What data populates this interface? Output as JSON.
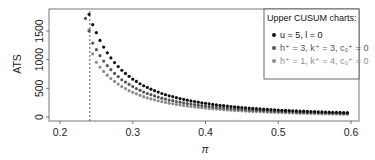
{
  "chart_data": {
    "type": "scatter",
    "title": "",
    "xlabel": "π",
    "ylabel": "ATS",
    "xlim": [
      0.185,
      0.61
    ],
    "ylim": [
      -60,
      1880
    ],
    "x_ticks": [
      0.2,
      0.3,
      0.4,
      0.5,
      0.6
    ],
    "x_tick_labels": [
      "0.2",
      "0.3",
      "0.4",
      "0.5",
      "0.6"
    ],
    "y_ticks": [
      0,
      500,
      1000,
      1500
    ],
    "y_tick_labels": [
      "0",
      "500",
      "1000",
      "1500"
    ],
    "grid": false,
    "reference_line": {
      "orientation": "vertical",
      "x": 0.241,
      "style": "dashed",
      "color": "#333333"
    },
    "legend": {
      "title": "Upper CUSUM charts:",
      "position": "top-right",
      "entries": [
        {
          "label": "u = 5, l = 0",
          "color": "#111111"
        },
        {
          "label": "h⁺ = 3, k⁺ = 3, c₀⁺ = 0",
          "color": "#555555"
        },
        {
          "label": "h⁺ = 1, k⁺ = 4, c₀⁺ = 0",
          "color": "#8c8c8c"
        }
      ]
    },
    "x": [
      0.24,
      0.245,
      0.25,
      0.255,
      0.26,
      0.265,
      0.27,
      0.275,
      0.28,
      0.285,
      0.29,
      0.295,
      0.3,
      0.305,
      0.31,
      0.315,
      0.32,
      0.325,
      0.33,
      0.335,
      0.34,
      0.345,
      0.35,
      0.355,
      0.36,
      0.365,
      0.37,
      0.375,
      0.38,
      0.385,
      0.39,
      0.395,
      0.4,
      0.405,
      0.41,
      0.415,
      0.42,
      0.425,
      0.43,
      0.435,
      0.44,
      0.445,
      0.45,
      0.455,
      0.46,
      0.465,
      0.47,
      0.475,
      0.48,
      0.485,
      0.49,
      0.495,
      0.5,
      0.505,
      0.51,
      0.515,
      0.52,
      0.525,
      0.53,
      0.535,
      0.54,
      0.545,
      0.55,
      0.555,
      0.56,
      0.565,
      0.57,
      0.575,
      0.58,
      0.585,
      0.59,
      0.595
    ],
    "series": [
      {
        "name": "u = 5, l = 0",
        "color": "#111111",
        "values": [
          1790,
          1610,
          1470,
          1335,
          1220,
          1120,
          1030,
          950,
          880,
          815,
          760,
          710,
          660,
          620,
          580,
          545,
          515,
          485,
          460,
          435,
          410,
          390,
          370,
          355,
          337,
          322,
          308,
          294,
          281,
          270,
          258,
          248,
          238,
          229,
          220,
          212,
          204,
          197,
          190,
          183,
          177,
          171,
          165,
          160,
          155,
          150,
          145,
          141,
          137,
          133,
          129,
          125,
          122,
          118,
          115,
          112,
          109,
          106,
          103,
          101,
          98,
          96,
          93,
          91,
          89,
          87,
          85,
          83,
          81,
          79,
          77,
          76
        ]
      },
      {
        "name": "h⁺ = 3, k⁺ = 3, c₀⁺ = 0",
        "color": "#555555",
        "start_point": {
          "x": 0.235,
          "y": 1720
        },
        "values": [
          1500,
          1290,
          1175,
          1070,
          975,
          895,
          825,
          760,
          705,
          650,
          610,
          570,
          530,
          495,
          465,
          435,
          410,
          390,
          368,
          348,
          328,
          312,
          296,
          284,
          270,
          258,
          246,
          235,
          225,
          216,
          206,
          198,
          190,
          183,
          176,
          170,
          163,
          158,
          152,
          146,
          142,
          137,
          132,
          128,
          124,
          120,
          116,
          113,
          110,
          106,
          103,
          100,
          98,
          94,
          92,
          90,
          87,
          85,
          82,
          81,
          78,
          77,
          74,
          73,
          71,
          70,
          68,
          66,
          65,
          63,
          62,
          61
        ]
      },
      {
        "name": "h⁺ = 1, k⁺ = 4, c₀⁺ = 0",
        "color": "#8c8c8c",
        "values": [
          1520,
          1100,
          955,
          870,
          795,
          730,
          670,
          620,
          575,
          530,
          495,
          460,
          430,
          405,
          378,
          355,
          335,
          316,
          299,
          283,
          267,
          254,
          241,
          231,
          219,
          209,
          200,
          191,
          183,
          176,
          168,
          161,
          155,
          149,
          143,
          138,
          133,
          128,
          124,
          119,
          115,
          111,
          107,
          104,
          101,
          98,
          94,
          92,
          89,
          86,
          84,
          81,
          79,
          77,
          75,
          73,
          71,
          69,
          67,
          66,
          64,
          62,
          60,
          59,
          58,
          57,
          55,
          54,
          53,
          51,
          50,
          49
        ]
      }
    ]
  }
}
